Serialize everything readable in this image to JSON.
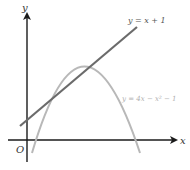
{
  "diagram": {
    "type": "coordinate-graph",
    "axes": {
      "x_label": "x",
      "y_label": "y",
      "origin_label": "O"
    },
    "line": {
      "equation_label": "y = x + 1",
      "color": "#6b6b6b"
    },
    "curve": {
      "equation_label": "y = 4x − x² − 1",
      "color": "#b5b5b5"
    },
    "colors": {
      "axis": "#1a1a1a",
      "background": "#ffffff"
    }
  }
}
